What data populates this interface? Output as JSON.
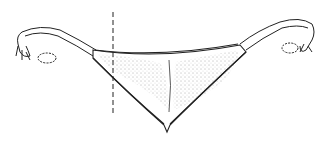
{
  "figure": {
    "annotation": "dashed-vertical-cut-line",
    "colors": {
      "background": "#ffffff",
      "line": "#222222",
      "stipple": "#555555"
    }
  }
}
